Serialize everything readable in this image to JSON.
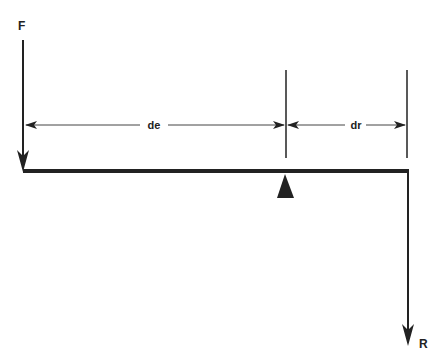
{
  "diagram": {
    "type": "lever",
    "labels": {
      "force": "F",
      "resistance": "R",
      "effort_distance": "de",
      "resistance_distance": "dr"
    },
    "colors": {
      "line": "#222222",
      "background": "#ffffff"
    }
  }
}
